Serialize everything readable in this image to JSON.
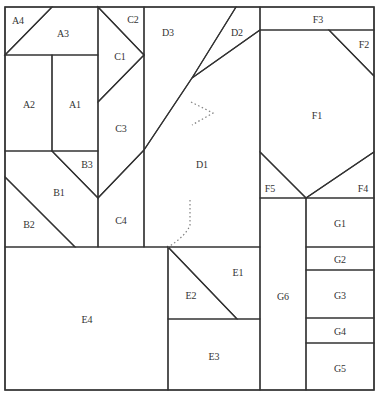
{
  "diagram": {
    "colors": {
      "white": "#ffffff",
      "light_gray": "#e6e6e6",
      "dark_gray": "#a3a3a3",
      "speckled_gray": "#c8c8c8",
      "stroke": "#333333"
    },
    "pieces": [
      {
        "id": "A1",
        "label": "A1",
        "fill": "white"
      },
      {
        "id": "A2",
        "label": "A2",
        "fill": "light_gray"
      },
      {
        "id": "A3",
        "label": "A3",
        "fill": "light_gray"
      },
      {
        "id": "A4",
        "label": "A4",
        "fill": "white"
      },
      {
        "id": "B1",
        "label": "B1",
        "fill": "light_gray"
      },
      {
        "id": "B2",
        "label": "B2",
        "fill": "white"
      },
      {
        "id": "B3",
        "label": "B3",
        "fill": "white"
      },
      {
        "id": "C1",
        "label": "C1",
        "fill": "light_gray"
      },
      {
        "id": "C2",
        "label": "C2",
        "fill": "white"
      },
      {
        "id": "C3",
        "label": "C3",
        "fill": "white"
      },
      {
        "id": "C4",
        "label": "C4",
        "fill": "light_gray"
      },
      {
        "id": "D1",
        "label": "D1",
        "fill": "light_gray"
      },
      {
        "id": "D2",
        "label": "D2",
        "fill": "white"
      },
      {
        "id": "D3",
        "label": "D3",
        "fill": "white"
      },
      {
        "id": "E1",
        "label": "E1",
        "fill": "light_gray"
      },
      {
        "id": "E2",
        "label": "E2",
        "fill": "white"
      },
      {
        "id": "E3",
        "label": "E3",
        "fill": "white"
      },
      {
        "id": "E4",
        "label": "E4",
        "fill": "white"
      },
      {
        "id": "F1",
        "label": "F1",
        "fill": "dark_gray"
      },
      {
        "id": "F2",
        "label": "F2",
        "fill": "white"
      },
      {
        "id": "F3",
        "label": "F3",
        "fill": "white"
      },
      {
        "id": "F4",
        "label": "F4",
        "fill": "light_gray"
      },
      {
        "id": "F5",
        "label": "F5",
        "fill": "light_gray"
      },
      {
        "id": "G1",
        "label": "G1",
        "fill": "speckled_gray"
      },
      {
        "id": "G2",
        "label": "G2",
        "fill": "white"
      },
      {
        "id": "G3",
        "label": "G3",
        "fill": "speckled_gray"
      },
      {
        "id": "G4",
        "label": "G4",
        "fill": "white"
      },
      {
        "id": "G5",
        "label": "G5",
        "fill": "speckled_gray"
      },
      {
        "id": "G6",
        "label": "G6",
        "fill": "speckled_gray"
      }
    ]
  }
}
